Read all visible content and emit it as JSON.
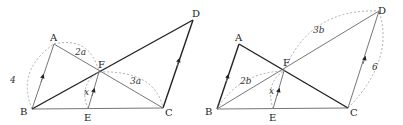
{
  "figures": [
    {
      "id": "left",
      "points": {
        "A": {
          "label": "A",
          "x": 54,
          "y": 44
        },
        "B": {
          "label": "B",
          "x": 32,
          "y": 109
        },
        "C": {
          "label": "C",
          "x": 163,
          "y": 108
        },
        "D": {
          "label": "D",
          "x": 193,
          "y": 20
        },
        "E": {
          "label": "E",
          "x": 88,
          "y": 109
        },
        "F": {
          "label": "F",
          "x": 99,
          "y": 72
        }
      },
      "measures": {
        "AB": "4",
        "AF": "2a",
        "FC": "3a",
        "EF": "x"
      },
      "parallel": [
        "AB",
        "EF",
        "CD"
      ]
    },
    {
      "id": "right",
      "points": {
        "A": {
          "label": "A",
          "x": 239,
          "y": 44
        },
        "B": {
          "label": "B",
          "x": 217,
          "y": 109
        },
        "C": {
          "label": "C",
          "x": 348,
          "y": 108
        },
        "D": {
          "label": "D",
          "x": 379,
          "y": 11
        },
        "E": {
          "label": "E",
          "x": 273,
          "y": 109
        },
        "F": {
          "label": "F",
          "x": 284,
          "y": 71
        }
      },
      "measures": {
        "BF": "2b",
        "FD": "3b",
        "CD": "6",
        "EF": "x"
      },
      "parallel": [
        "AB",
        "EF",
        "CD"
      ]
    }
  ]
}
